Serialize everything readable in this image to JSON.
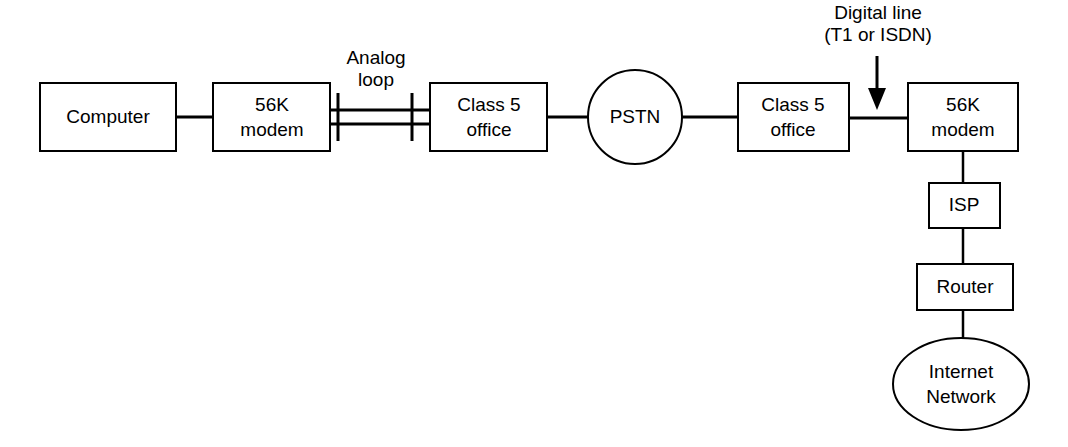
{
  "diagram": {
    "type": "network-topology",
    "background_color": "#ffffff",
    "line_color": "#000000",
    "text_color": "#000000",
    "nodes": [
      {
        "id": "computer",
        "label": "Computer",
        "shape": "rectangle",
        "x": 40,
        "y": 83,
        "width": 136,
        "height": 68
      },
      {
        "id": "modem-left",
        "label_line1": "56K",
        "label_line2": "modem",
        "shape": "rectangle",
        "x": 213,
        "y": 83,
        "width": 117,
        "height": 68
      },
      {
        "id": "class5-left",
        "label_line1": "Class 5",
        "label_line2": "office",
        "shape": "rectangle",
        "x": 430,
        "y": 83,
        "width": 117,
        "height": 68
      },
      {
        "id": "pstn",
        "label": "PSTN",
        "shape": "circle",
        "cx": 635,
        "cy": 117,
        "r": 47
      },
      {
        "id": "class5-right",
        "label_line1": "Class 5",
        "label_line2": "office",
        "shape": "rectangle",
        "x": 738,
        "y": 83,
        "width": 111,
        "height": 68
      },
      {
        "id": "modem-right",
        "label_line1": "56K",
        "label_line2": "modem",
        "shape": "rectangle",
        "x": 908,
        "y": 83,
        "width": 110,
        "height": 68
      },
      {
        "id": "isp",
        "label": "ISP",
        "shape": "rectangle",
        "x": 929,
        "y": 183,
        "width": 71,
        "height": 45
      },
      {
        "id": "router",
        "label": "Router",
        "shape": "rectangle",
        "x": 917,
        "y": 264,
        "width": 96,
        "height": 46
      },
      {
        "id": "internet",
        "label_line1": "Internet",
        "label_line2": "Network",
        "shape": "ellipse",
        "cx": 961,
        "cy": 384,
        "rx": 68,
        "ry": 46
      }
    ],
    "annotations": [
      {
        "id": "analog-loop",
        "label_line1": "Analog",
        "label_line2": "loop",
        "x": 376,
        "y1": 59,
        "y2": 81
      },
      {
        "id": "digital-line",
        "label_line1": "Digital line",
        "label_line2": "(T1 or ISDN)",
        "x": 878,
        "y1": 14,
        "y2": 36
      }
    ]
  }
}
